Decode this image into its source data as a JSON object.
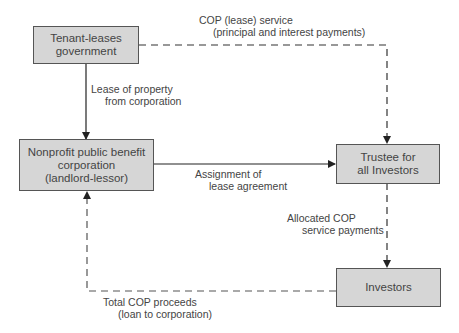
{
  "diagram": {
    "nodes": [
      {
        "id": "tenant",
        "label": "Tenant-leases government"
      },
      {
        "id": "nonprofit",
        "label": "Nonprofit public benefit corporation (landlord-lessor)"
      },
      {
        "id": "trustee",
        "label": "Trustee for all Investors"
      },
      {
        "id": "investors",
        "label": "Investors"
      }
    ],
    "boxes": {
      "tenant": {
        "line1": "Tenant-leases",
        "line2": "government"
      },
      "nonprofit": {
        "line1": "Nonprofit public benefit",
        "line2": "corporation",
        "line3": "(landlord-lessor)"
      },
      "trustee": {
        "line1": "Trustee for",
        "line2": "all Investors"
      },
      "investors": {
        "line1": "Investors"
      }
    },
    "edges": {
      "lease_service": {
        "from": "tenant",
        "to": "trustee",
        "style": "dashed",
        "line1": "COP (lease) service",
        "line2": "(principal and interest payments)"
      },
      "lease_property": {
        "from": "tenant",
        "to": "nonprofit",
        "style": "solid",
        "line1": "Lease of property",
        "line2": "from corporation"
      },
      "assignment": {
        "from": "nonprofit",
        "to": "trustee",
        "style": "solid",
        "line1": "Assignment of",
        "line2": "lease agreement"
      },
      "allocated": {
        "from": "trustee",
        "to": "investors",
        "style": "dashed",
        "line1": "Allocated COP",
        "line2": "service payments"
      },
      "proceeds": {
        "from": "investors",
        "to": "nonprofit",
        "style": "dashed",
        "line1": "Total COP proceeds",
        "line2": "(loan to corporation)"
      }
    },
    "colors": {
      "box_fill": "#d6d6d6",
      "line": "#333333",
      "dashed": "#555555"
    }
  }
}
